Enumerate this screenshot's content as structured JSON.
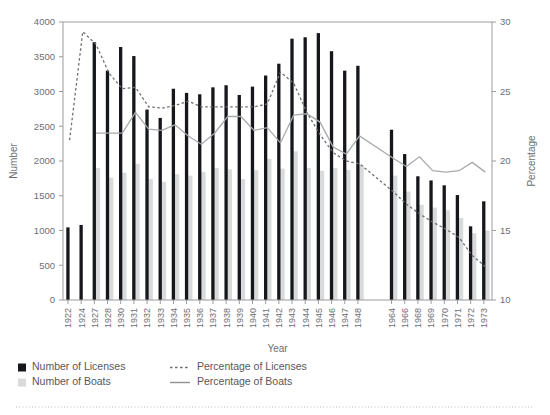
{
  "chart_data": {
    "type": "bar",
    "title": "",
    "xlabel": "Year",
    "ylabel": "Number",
    "y2label": "Percentage",
    "ylim": [
      0,
      4000
    ],
    "y2lim": [
      10,
      30
    ],
    "yticks": [
      0,
      500,
      1000,
      1500,
      2000,
      2500,
      3000,
      3500,
      4000
    ],
    "y2ticks": [
      10,
      15,
      20,
      25,
      30
    ],
    "grid": false,
    "legend_position": "bottom-left",
    "categories": [
      "1922",
      "1924",
      "1927",
      "1928",
      "1930",
      "1931",
      "1932",
      "1933",
      "1934",
      "1935",
      "1936",
      "1937",
      "1938",
      "1939",
      "1940",
      "1941",
      "1942",
      "1943",
      "1944",
      "1945",
      "1946",
      "1947",
      "1948",
      "1964",
      "1966",
      "1968",
      "1969",
      "1970",
      "1971",
      "1972",
      "1973"
    ],
    "series": [
      {
        "name": "Number of Licenses",
        "type": "bar",
        "color": "#16171b",
        "axis": "left",
        "values": [
          1045,
          1080,
          3710,
          3300,
          3640,
          3510,
          2740,
          2620,
          3040,
          2980,
          2960,
          3060,
          3090,
          2950,
          3070,
          3230,
          3400,
          3760,
          3780,
          3840,
          3580,
          3300,
          3370,
          2450,
          2100,
          1780,
          1720,
          1650,
          1510,
          1060,
          1420
        ]
      },
      {
        "name": "Number of Boats",
        "type": "bar",
        "color": "#d9dadb",
        "axis": "left",
        "values": [
          null,
          null,
          1900,
          1760,
          1830,
          1960,
          1740,
          1700,
          1810,
          1790,
          1840,
          1900,
          1880,
          1740,
          1870,
          2030,
          1890,
          2140,
          1900,
          1860,
          1900,
          1870,
          1940,
          1790,
          1560,
          1370,
          1330,
          1290,
          1180,
          960,
          1000
        ]
      },
      {
        "name": "Percentage of Licenses",
        "type": "line",
        "style": "dashed",
        "color": "#6e6f71",
        "axis": "right",
        "values": [
          21.5,
          29.3,
          28.4,
          26.3,
          25.2,
          25.3,
          23.9,
          23.8,
          24.0,
          24.3,
          23.9,
          23.9,
          23.9,
          23.9,
          23.9,
          24.1,
          26.4,
          25.6,
          23.5,
          21.9,
          20.6,
          20.0,
          19.8,
          17.8,
          16.9,
          16.2,
          15.6,
          15.1,
          14.5,
          13.2,
          12.4
        ]
      },
      {
        "name": "Percentage of Boats",
        "type": "line",
        "style": "solid",
        "color": "#a9aaac",
        "axis": "right",
        "values": [
          null,
          null,
          22.0,
          22.0,
          22.0,
          23.5,
          22.3,
          22.2,
          22.6,
          21.8,
          21.2,
          22.0,
          23.2,
          23.2,
          22.2,
          22.4,
          21.3,
          23.3,
          23.4,
          22.8,
          21.0,
          20.5,
          21.8,
          20.2,
          19.6,
          20.3,
          19.3,
          19.2,
          19.3,
          19.9,
          19.2
        ]
      }
    ]
  },
  "legend": {
    "items": [
      {
        "label": "Number of Licenses",
        "marker": "square-black"
      },
      {
        "label": "Number of Boats",
        "marker": "square-gray"
      },
      {
        "label": "Percentage of Licenses",
        "marker": "line-dashed"
      },
      {
        "label": "Percentage of Boats",
        "marker": "line-solid"
      }
    ]
  }
}
